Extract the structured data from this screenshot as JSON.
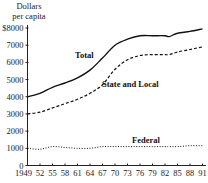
{
  "chart_data": {
    "type": "line",
    "title": "",
    "ylabel": "Dollars per capita",
    "ylabel_lines": [
      "Dollars",
      "per capita"
    ],
    "xlabel": "",
    "xlim": [
      1949,
      1991
    ],
    "ylim": [
      0,
      8000
    ],
    "grid": false,
    "legend": "inline labels",
    "y_ticks": [
      0,
      1000,
      2000,
      3000,
      4000,
      5000,
      6000,
      7000,
      8000
    ],
    "y_tick_labels": [
      "0",
      "1000",
      "2000",
      "3000",
      "4000",
      "5000",
      "6000",
      "7000",
      "$8000"
    ],
    "x_ticks": [
      1949,
      1952,
      1955,
      1958,
      1961,
      1964,
      1967,
      1970,
      1973,
      1976,
      1979,
      1982,
      1985,
      1988,
      1991
    ],
    "x_tick_labels": [
      "1949",
      "52",
      "55",
      "58",
      "61",
      "64",
      "67",
      "70",
      "73",
      "76",
      "79",
      "82",
      "85",
      "88",
      "91"
    ],
    "x": [
      1949,
      1952,
      1955,
      1958,
      1961,
      1964,
      1967,
      1970,
      1973,
      1976,
      1979,
      1982,
      1983,
      1985,
      1988,
      1991
    ],
    "series": [
      {
        "name": "Total",
        "style": "solid",
        "values": [
          4000,
          4200,
          4550,
          4800,
          5100,
          5550,
          6250,
          7000,
          7350,
          7550,
          7550,
          7550,
          7500,
          7700,
          7800,
          7950
        ]
      },
      {
        "name": "State and Local",
        "style": "dashed",
        "values": [
          3000,
          3100,
          3350,
          3600,
          3850,
          4200,
          4700,
          5600,
          6150,
          6400,
          6450,
          6450,
          6450,
          6600,
          6750,
          6900
        ]
      },
      {
        "name": "Federal",
        "style": "dotted",
        "values": [
          1000,
          950,
          1100,
          1050,
          1000,
          1000,
          1100,
          1100,
          1100,
          1100,
          1100,
          1100,
          1100,
          1100,
          1150,
          1150
        ]
      }
    ]
  }
}
